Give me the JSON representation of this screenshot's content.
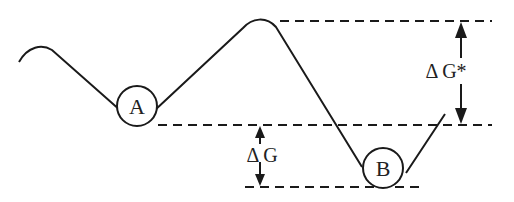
{
  "diagram": {
    "type": "energy-landscape",
    "labels": {
      "state_a": "A",
      "state_b": "B",
      "delta_g": "Δ G",
      "delta_g_activation": "Δ G*"
    },
    "colors": {
      "stroke": "#1a1a1a",
      "background": "#ffffff"
    }
  }
}
